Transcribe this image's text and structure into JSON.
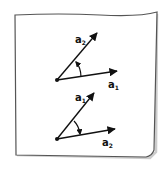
{
  "diagram": {
    "type": "vector-angle-illustration",
    "colors": {
      "ink": "#111111",
      "frame": "#666666",
      "shadow": "#999999",
      "paper": "#ffffff"
    },
    "panels": [
      {
        "name": "top",
        "origin": [
          57,
          80
        ],
        "vectors": [
          {
            "label": "a",
            "sub": "2",
            "tip": [
              98,
              32
            ]
          },
          {
            "label": "a",
            "sub": "1",
            "tip": [
              118,
              71
            ]
          }
        ],
        "angle_arrow_direction": "from a1 toward a2 (counterclockwise)"
      },
      {
        "name": "bottom",
        "origin": [
          57,
          139
        ],
        "vectors": [
          {
            "label": "a",
            "sub": "1",
            "tip": [
              95,
              92
            ]
          },
          {
            "label": "a",
            "sub": "2",
            "tip": [
              116,
              129
            ]
          }
        ],
        "angle_arrow_direction": "from a1 toward a2 (clockwise)"
      }
    ]
  }
}
